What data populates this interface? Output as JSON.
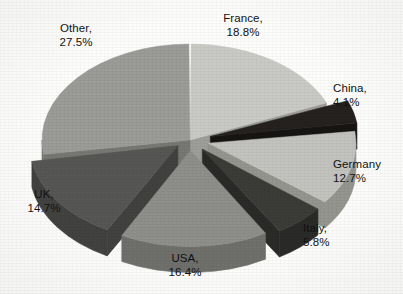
{
  "chart_data": {
    "type": "pie",
    "title": "",
    "subtitle": "",
    "xlabel": "",
    "ylabel": "",
    "legend_position": "none",
    "label_format": "{name}, {value}%",
    "units": "percent",
    "total": 100.0,
    "style": {
      "three_d": true,
      "exploded": true,
      "grayscale": true,
      "background": "#fdfdfc",
      "start_angle_deg": 0,
      "direction": "clockwise",
      "depth_px": 26,
      "rx": 148,
      "ry": 96,
      "center_x": 190,
      "center_y": 140
    },
    "categories": [
      "France",
      "China",
      "Germany",
      "Italy",
      "USA",
      "UK",
      "Other"
    ],
    "values": [
      18.8,
      4.1,
      12.7,
      5.8,
      16.4,
      14.7,
      27.5
    ],
    "slices": [
      {
        "name": "France",
        "value": 18.8,
        "label": "France,",
        "value_label": "18.8%",
        "top_color": "#c9c9c5",
        "side_color": "#9d9d99",
        "explode": 0.0,
        "label_x": 243,
        "label_y": 12,
        "label_align": "lbl-center"
      },
      {
        "name": "China",
        "value": 4.1,
        "label": "China,",
        "value_label": "4.1%",
        "top_color": "#24211f",
        "side_color": "#171514",
        "explode": 0.34,
        "label_x": 333,
        "label_y": 82,
        "label_align": "lbl-left"
      },
      {
        "name": "Germany",
        "value": 12.7,
        "label": "Germany",
        "value_label": "12.7%",
        "top_color": "#c2c2be",
        "side_color": "#95958f",
        "explode": 0.3,
        "label_x": 333,
        "label_y": 158,
        "label_align": "lbl-left"
      },
      {
        "name": "Italy",
        "value": 5.8,
        "label": "Italy,",
        "value_label": "5.8%",
        "top_color": "#3b3b38",
        "side_color": "#2a2a28",
        "explode": 0.3,
        "label_x": 303,
        "label_y": 222,
        "label_align": "lbl-left"
      },
      {
        "name": "USA",
        "value": 16.4,
        "label": "USA,",
        "value_label": "16.4%",
        "top_color": "#8e8e8b",
        "side_color": "#6f6f6c",
        "explode": 0.26,
        "label_x": 185,
        "label_y": 252,
        "label_align": "lbl-center"
      },
      {
        "name": "UK",
        "value": 14.7,
        "label": "UK,",
        "value_label": "14.7%",
        "top_color": "#565654",
        "side_color": "#414140",
        "explode": 0.24,
        "label_x": 44,
        "label_y": 188,
        "label_align": "lbl-center"
      },
      {
        "name": "Other",
        "value": 27.5,
        "label": "Other,",
        "value_label": "27.5%",
        "top_color": "#9b9b98",
        "side_color": "#777774",
        "explode": 0.0,
        "label_x": 76,
        "label_y": 22,
        "label_align": "lbl-center"
      }
    ]
  }
}
